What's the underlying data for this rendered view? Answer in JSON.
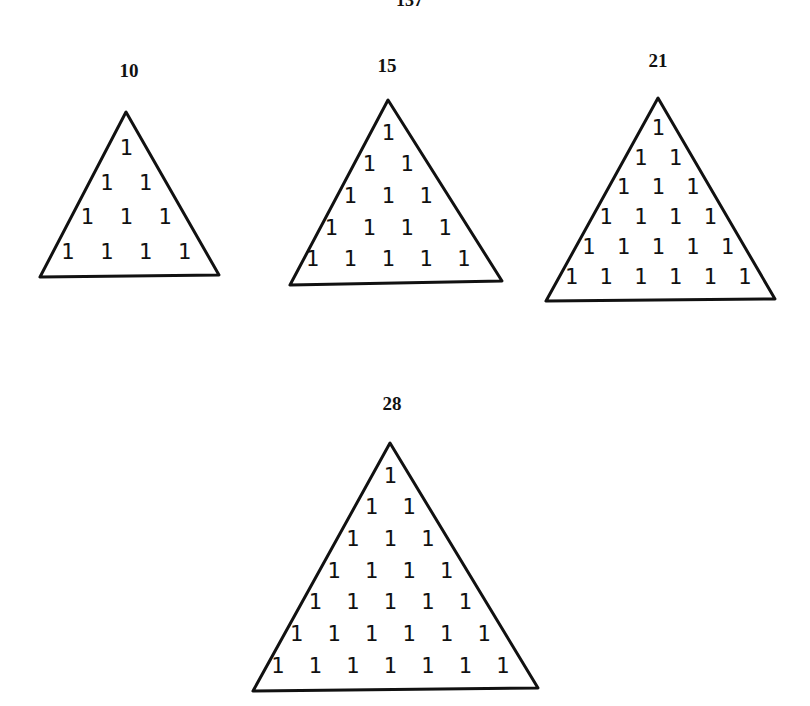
{
  "page": {
    "number": "137"
  },
  "figures": [
    {
      "label": "10",
      "rows": 4,
      "entry": "1",
      "apex": [
        126,
        112
      ],
      "left": [
        40,
        277
      ],
      "right": [
        219,
        275
      ]
    },
    {
      "label": "15",
      "rows": 5,
      "entry": "1",
      "apex": [
        388,
        100
      ],
      "left": [
        290,
        285
      ],
      "right": [
        502,
        281
      ]
    },
    {
      "label": "21",
      "rows": 6,
      "entry": "1",
      "apex": [
        658,
        98
      ],
      "left": [
        546,
        301
      ],
      "right": [
        775,
        299
      ]
    },
    {
      "label": "28",
      "rows": 7,
      "entry": "1",
      "apex": [
        390,
        443
      ],
      "left": [
        253,
        691
      ],
      "right": [
        538,
        688
      ]
    }
  ],
  "label_positions": [
    [
      99,
      60
    ],
    [
      357,
      55
    ],
    [
      628,
      50
    ],
    [
      362,
      393
    ]
  ]
}
